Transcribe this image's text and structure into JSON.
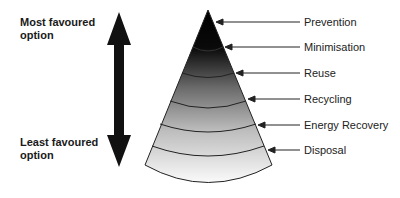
{
  "diagram": {
    "top_label": {
      "line1": "Most favoured",
      "line2": "option"
    },
    "bottom_label": {
      "line1": "Least favoured",
      "line2": "option"
    },
    "levels": [
      {
        "label": "Prevention",
        "y": 22
      },
      {
        "label": "Minimisation",
        "y": 47
      },
      {
        "label": "Reuse",
        "y": 73
      },
      {
        "label": "Recycling",
        "y": 99
      },
      {
        "label": "Energy Recovery",
        "y": 125
      },
      {
        "label": "Disposal",
        "y": 150
      }
    ],
    "colors": {
      "dark": "#000000",
      "light": "#ffffff",
      "line": "#222222"
    }
  }
}
